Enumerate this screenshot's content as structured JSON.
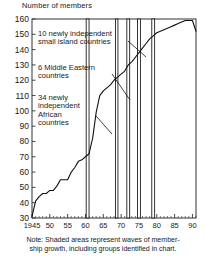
{
  "chart_data": {
    "type": "line",
    "title": "Number of members",
    "xlabel": "",
    "ylabel": "Number of members",
    "ylim": [
      30,
      160
    ],
    "xlim": [
      1945,
      1991
    ],
    "yticks": [
      30,
      40,
      50,
      60,
      70,
      80,
      90,
      100,
      110,
      120,
      130,
      140,
      150,
      160
    ],
    "xticks": [
      1945,
      1950,
      1955,
      1960,
      1965,
      1970,
      1975,
      1980,
      1985,
      1990
    ],
    "xticklabels": [
      "1945",
      "50",
      "55",
      "60",
      "65",
      "70",
      "75",
      "80",
      "85",
      "90"
    ],
    "grid": false,
    "legend": "none",
    "series": [
      {
        "name": "UN membership",
        "x": [
          1945,
          1946,
          1947,
          1948,
          1949,
          1950,
          1951,
          1952,
          1953,
          1954,
          1955,
          1956,
          1957,
          1958,
          1959,
          1960,
          1961,
          1962,
          1963,
          1964,
          1965,
          1966,
          1967,
          1968,
          1969,
          1970,
          1971,
          1972,
          1973,
          1974,
          1975,
          1976,
          1977,
          1978,
          1979,
          1980,
          1981,
          1982,
          1983,
          1984,
          1985,
          1986,
          1987,
          1988,
          1989,
          1990,
          1991
        ],
        "values": [
          31,
          41,
          44,
          46,
          46,
          48,
          48,
          51,
          55,
          55,
          55,
          60,
          63,
          67,
          68,
          70,
          72,
          82,
          99,
          110,
          113,
          115,
          117,
          120,
          122,
          124,
          126,
          130,
          132,
          135,
          138,
          141,
          144,
          147,
          149,
          151,
          152,
          153,
          154,
          155,
          156,
          157,
          158,
          159,
          159,
          159,
          152
        ]
      }
    ],
    "shaded_bands": [
      {
        "start": 1960.2,
        "end": 1961.0,
        "label": "wave-1"
      },
      {
        "start": 1968.4,
        "end": 1969.1,
        "label": "wave-2"
      },
      {
        "start": 1971.6,
        "end": 1972.4,
        "label": "wave-3"
      },
      {
        "start": 1974.6,
        "end": 1975.4,
        "label": "wave-4"
      },
      {
        "start": 1978.6,
        "end": 1979.4,
        "label": "wave-5"
      }
    ],
    "annotations": [
      {
        "id": "island-countries",
        "lines": [
          "10 newly independent",
          "small island countries"
        ],
        "text": "10 newly independent small island countries",
        "point_x": 1975.2,
        "point_y": 128
      },
      {
        "id": "middle-eastern",
        "lines": [
          "6 Middle Eastern",
          "countries"
        ],
        "text": "6 Middle Eastern countries",
        "point_x": 1969.2,
        "point_y": 113
      },
      {
        "id": "african-countries",
        "lines": [
          "34 newly",
          "independent",
          "African",
          "countries"
        ],
        "text": "34 newly independent African countries",
        "point_x": 1961.8,
        "point_y": 92
      }
    ]
  },
  "note": {
    "line1": "Note:  Shaded areas represent waves of member-",
    "line2": "ship growth, including groups identified in chart."
  },
  "colors": {
    "background": "#ffffff",
    "ink": "#1a1a1a",
    "line": "#111111",
    "frame": "#333333"
  }
}
